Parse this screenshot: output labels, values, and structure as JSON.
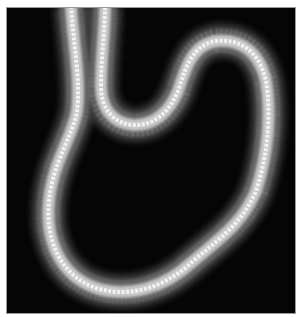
{
  "image": {
    "description": "Grayscale image of a glowing tube-shaped (snake-like) form looping on a black background",
    "background_color": "#050505",
    "border_color": "#9a9a9a",
    "tube": {
      "core_color": "#f2f2f2",
      "mid_color": "#9e9e9e",
      "edge_color": "#3a3a3a"
    }
  }
}
